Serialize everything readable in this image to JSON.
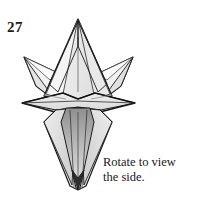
{
  "page": {
    "background_color": "#ffffff",
    "width": 206,
    "height": 206,
    "kind": "origami-instruction-step"
  },
  "step": {
    "number": "27"
  },
  "caption": {
    "line1": "Rotate to view",
    "line2": "the side."
  },
  "figure": {
    "name": "origami-star-model",
    "colors": {
      "outline": "#1b1b1b",
      "outline_soft": "#6d6d6d",
      "fill_light": "#f1f1f1",
      "fill_mid": "#e2e2e2",
      "fill_shade": "#d2d2d2",
      "fill_dark": "#9d9d9d",
      "fill_darker": "#7a7a7a",
      "crease": "#8a8a8a"
    }
  }
}
